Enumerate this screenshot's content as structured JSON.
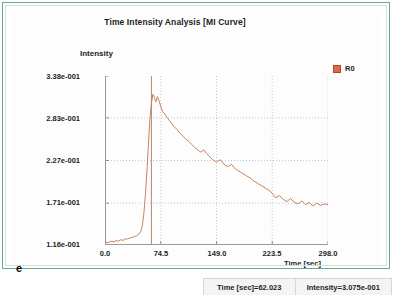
{
  "panel_letter": "e",
  "chart_title": "Time Intensity Analysis [MI Curve]",
  "legend": {
    "series_label": "R0",
    "swatch_color": "#e2684a"
  },
  "status_bar": {
    "time_readout": "Time [sec]=62.023",
    "intensity_readout": "Intensity=3.075e-001"
  },
  "chart_data": {
    "type": "line",
    "title": "Time Intensity Analysis [MI Curve]",
    "xlabel": "Time [sec]",
    "ylabel": "Intensity",
    "xlim": [
      0.0,
      298.0
    ],
    "ylim": [
      0.116,
      0.338
    ],
    "grid": true,
    "legend_position": "top-right",
    "xticks": [
      "0.0",
      "74.5",
      "149.0",
      "223.5",
      "298.0"
    ],
    "xtick_values": [
      0.0,
      74.5,
      149.0,
      223.5,
      298.0
    ],
    "yticks": [
      "1.16e-001",
      "1.71e-001",
      "2.27e-001",
      "2.83e-001",
      "3.38e-001"
    ],
    "ytick_values": [
      0.116,
      0.171,
      0.227,
      0.283,
      0.338
    ],
    "cursor": {
      "time": 62.023,
      "intensity": 0.3075,
      "label": "cursor-line"
    },
    "series": [
      {
        "name": "R0",
        "color": "#c8825f",
        "x": [
          0.0,
          3.0,
          6.0,
          9.0,
          12.0,
          15.0,
          18.0,
          21.0,
          24.0,
          27.0,
          30.0,
          33.0,
          36.0,
          39.0,
          42.0,
          45.0,
          48.0,
          50.0,
          52.0,
          54.0,
          56.0,
          58.0,
          60.0,
          62.0,
          64.0,
          66.0,
          68.0,
          70.0,
          72.0,
          74.5,
          77.0,
          80.0,
          84.0,
          88.0,
          92.0,
          96.0,
          100.0,
          104.0,
          108.0,
          112.0,
          116.0,
          120.0,
          124.0,
          128.0,
          132.0,
          136.0,
          140.0,
          144.0,
          149.0,
          154.0,
          159.0,
          164.0,
          169.0,
          174.0,
          179.0,
          184.0,
          189.0,
          194.0,
          199.0,
          204.0,
          209.0,
          214.0,
          219.0,
          223.5,
          228.0,
          233.0,
          238.0,
          243.0,
          248.0,
          253.0,
          258.0,
          263.0,
          268.0,
          273.0,
          278.0,
          283.0,
          288.0,
          293.0,
          298.0
        ],
        "y": [
          0.12,
          0.119,
          0.12,
          0.121,
          0.12,
          0.122,
          0.121,
          0.123,
          0.122,
          0.124,
          0.124,
          0.125,
          0.126,
          0.127,
          0.128,
          0.13,
          0.134,
          0.142,
          0.158,
          0.182,
          0.212,
          0.248,
          0.281,
          0.302,
          0.314,
          0.31,
          0.304,
          0.311,
          0.306,
          0.298,
          0.291,
          0.288,
          0.282,
          0.277,
          0.272,
          0.268,
          0.263,
          0.259,
          0.255,
          0.252,
          0.248,
          0.244,
          0.241,
          0.238,
          0.241,
          0.236,
          0.232,
          0.228,
          0.225,
          0.228,
          0.222,
          0.219,
          0.222,
          0.216,
          0.213,
          0.21,
          0.207,
          0.204,
          0.2,
          0.197,
          0.194,
          0.191,
          0.188,
          0.184,
          0.178,
          0.181,
          0.176,
          0.173,
          0.177,
          0.172,
          0.17,
          0.174,
          0.169,
          0.172,
          0.167,
          0.171,
          0.168,
          0.17,
          0.169
        ]
      }
    ]
  }
}
